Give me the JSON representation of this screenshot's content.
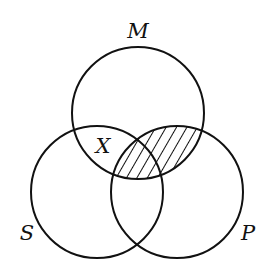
{
  "diagram": {
    "type": "venn-3-circle",
    "circles": [
      {
        "id": "M",
        "label": "M"
      },
      {
        "id": "S",
        "label": "S"
      },
      {
        "id": "P",
        "label": "P"
      }
    ],
    "marks": {
      "x_label": "X",
      "x_region": "S∩M outside P",
      "shaded_region": "M∩P (hatched)"
    },
    "colors": {
      "stroke": "#111111",
      "background": "#ffffff"
    }
  }
}
